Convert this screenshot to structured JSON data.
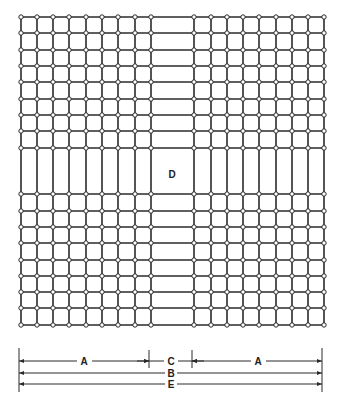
{
  "figure": {
    "colors": {
      "line": "#2a2a2a",
      "node_fill": "#ffffff",
      "background": "#ffffff"
    },
    "grid": {
      "columns_x": [
        21,
        37,
        53,
        69,
        86,
        102,
        118,
        135,
        151,
        194,
        211,
        227,
        243,
        259,
        276,
        292,
        308,
        324
      ],
      "rows_y": [
        17,
        33,
        50,
        66,
        82,
        99,
        115,
        131,
        148,
        194,
        211,
        227,
        243,
        260,
        276,
        292,
        308,
        325
      ],
      "top": 17,
      "bottom": 325,
      "left": 21,
      "right": 324
    },
    "center_area": {
      "label": "D",
      "x": 151,
      "y": 148,
      "w": 43,
      "h": 46
    },
    "dimensions": {
      "A_left": {
        "label": "A",
        "x1": 19,
        "x2": 149,
        "y": 361
      },
      "C": {
        "label": "C",
        "x1": 149,
        "x2": 192,
        "y": 361
      },
      "A_right": {
        "label": "A",
        "x1": 192,
        "x2": 322,
        "y": 361
      },
      "B": {
        "label": "B",
        "x1": 19,
        "x2": 322,
        "y": 373
      },
      "E": {
        "label": "E",
        "x1": 19,
        "x2": 322,
        "y": 384
      }
    }
  }
}
